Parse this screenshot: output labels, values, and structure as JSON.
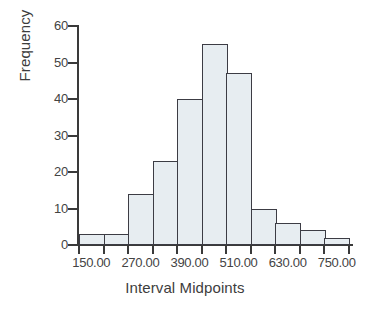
{
  "chart_data": {
    "type": "bar",
    "title": "",
    "subtitle": "",
    "xlabel": "Interval Midpoints",
    "ylabel": "Frequency",
    "categories": [
      "150.00",
      "210.00",
      "270.00",
      "330.00",
      "390.00",
      "450.00",
      "510.00",
      "570.00",
      "630.00",
      "690.00",
      "750.00"
    ],
    "values": [
      3,
      3,
      14,
      23,
      40,
      55,
      47,
      10,
      6,
      4,
      2
    ],
    "bin_width": 60,
    "ylim": [
      0,
      60
    ],
    "xlim": [
      120,
      780
    ],
    "y_ticks": [
      0,
      10,
      20,
      30,
      40,
      50,
      60
    ],
    "y_tick_labels": [
      "0",
      "10",
      "20",
      "30",
      "40",
      "50",
      "60"
    ],
    "x_tick_values": [
      120,
      180,
      240,
      300,
      360,
      420,
      480,
      540,
      600,
      660,
      720,
      780
    ],
    "x_tick_labels": [
      "150.00",
      "270.00",
      "390.00",
      "510.00",
      "630.00",
      "750.00"
    ],
    "x_tick_label_values": [
      150,
      270,
      390,
      510,
      630,
      750
    ],
    "grid": false,
    "legend": null,
    "bar_fill_color": "#e7edf1",
    "bar_edge_color": "#3c3c44",
    "axis_color": "#3a3a3a",
    "text_color": "#434343",
    "background_color": "#ffffff"
  }
}
